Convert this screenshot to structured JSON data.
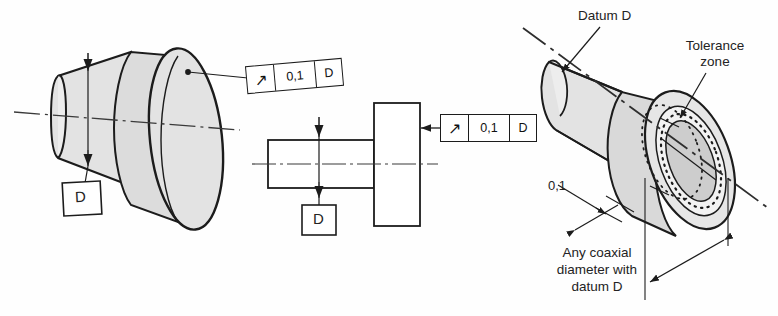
{
  "drawing": {
    "title": "Circular runout tolerance — ISO GD&T illustration",
    "standard_notation": "ISO GPS",
    "decimal_separator": "comma"
  },
  "feature_control_frames": [
    {
      "id": "fcf-left",
      "symbol": "circular-runout",
      "symbol_glyph": "↗",
      "tolerance": "0,1",
      "datum": "D"
    },
    {
      "id": "fcf-middle",
      "symbol": "circular-runout",
      "symbol_glyph": "↗",
      "tolerance": "0,1",
      "datum": "D"
    }
  ],
  "datum_features": [
    {
      "id": "datum-left",
      "letter": "D"
    },
    {
      "id": "datum-middle",
      "letter": "D"
    }
  ],
  "annotations": {
    "datum_callout": "Datum D",
    "tolerance_zone_line1": "Tolerance",
    "tolerance_zone_line2": "zone",
    "zone_width": "0,1",
    "coaxial_line1": "Any coaxial",
    "coaxial_line2": "diameter with",
    "coaxial_line3": "datum D"
  },
  "views": [
    {
      "id": "view-left-pictorial",
      "name": "Pictorial toleranced part"
    },
    {
      "id": "view-middle-orthographic",
      "name": "Orthographic side view"
    },
    {
      "id": "view-right-pictorial",
      "name": "Tolerance zone interpretation"
    }
  ],
  "colors": {
    "line": "#1c1c1c",
    "fill_light": "#e6e6e6",
    "fill_mid": "#d8d8d8",
    "fill_dark": "#cfcfcf",
    "paper": "#fefefe",
    "axis": "#3a3a3a"
  }
}
